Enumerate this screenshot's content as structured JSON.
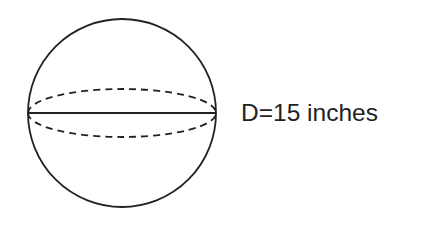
{
  "figure": {
    "shape": "sphere",
    "label": "D=15 inches",
    "stroke_color": "#222222",
    "background": "#ffffff",
    "elements": {
      "outline": "circle",
      "diameter_line": "solid horizontal",
      "equator": "dashed ellipse"
    }
  }
}
